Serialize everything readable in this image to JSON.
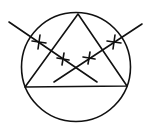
{
  "diagram": {
    "stroke_color": "#111111",
    "background": "#ffffff",
    "circle": {
      "cx": 76,
      "cy": 67,
      "r": 54.5
    },
    "triangle": {
      "points": [
        [
          78,
          14
        ],
        [
          25,
          87
        ],
        [
          127,
          86
        ]
      ]
    },
    "lines": [
      {
        "id": "line-descending",
        "x1": 9,
        "y1": 22,
        "x2": 97,
        "y2": 82
      },
      {
        "id": "line-ascending",
        "x1": 54,
        "y1": 82,
        "x2": 142,
        "y2": 24
      }
    ],
    "markers": [
      {
        "id": "marker-1",
        "x": 39,
        "y": 42,
        "size": 7
      },
      {
        "id": "marker-2",
        "x": 63,
        "y": 59,
        "size": 6
      },
      {
        "id": "marker-3",
        "x": 89,
        "y": 58,
        "size": 6
      },
      {
        "id": "marker-4",
        "x": 114,
        "y": 42,
        "size": 7
      }
    ]
  }
}
